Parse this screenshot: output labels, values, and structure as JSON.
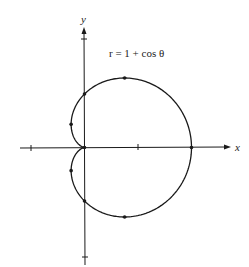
{
  "figure": {
    "equation_label": "r = 1 + cos θ",
    "x_axis_label": "x",
    "y_axis_label": "y",
    "curve_type": "cardioid",
    "stroke_color": "#1a1a1a",
    "background": "#ffffff"
  },
  "chart_data": {
    "type": "line",
    "title": "r = 1 + cos θ",
    "xlabel": "x",
    "ylabel": "y",
    "polar_equation": "r = 1 + cos(theta)",
    "x_ticks": [
      -1,
      1
    ],
    "y_ticks": [
      2,
      -2
    ],
    "xlim": [
      -1.2,
      2.7
    ],
    "ylim": [
      -2.1,
      2.3
    ],
    "grid": false,
    "marked_points": [
      {
        "theta_deg": 0,
        "x": 2,
        "y": 0
      },
      {
        "theta_deg": 60,
        "x": 0.75,
        "y": 1.299
      },
      {
        "theta_deg": 90,
        "x": 0,
        "y": 1
      },
      {
        "theta_deg": 120,
        "x": -0.25,
        "y": 0.433
      },
      {
        "theta_deg": 180,
        "x": 0,
        "y": 0
      },
      {
        "theta_deg": 240,
        "x": -0.25,
        "y": -0.433
      },
      {
        "theta_deg": 270,
        "x": 0,
        "y": -1
      },
      {
        "theta_deg": 300,
        "x": 0.75,
        "y": -1.299
      }
    ]
  }
}
